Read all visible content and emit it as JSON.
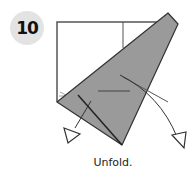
{
  "step": {
    "number": "10"
  },
  "caption": "Unfold.",
  "colors": {
    "paper": "#ffffff",
    "fold": "#9a9a9a",
    "line": "#333333",
    "badge": "#e3e3e3"
  }
}
